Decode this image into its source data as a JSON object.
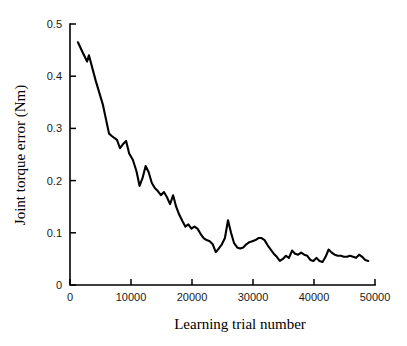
{
  "chart_data": {
    "type": "line",
    "title": "",
    "subtitle": "",
    "xlabel": "Learning trial number",
    "ylabel": "Joint torque error (Nm)",
    "xlim": [
      0,
      50000
    ],
    "ylim": [
      0,
      0.5
    ],
    "xticks": [
      0,
      10000,
      20000,
      30000,
      40000,
      50000
    ],
    "xtick_labels": [
      "0",
      "10000",
      "20000",
      "30000",
      "40000",
      "50000"
    ],
    "yticks": [
      0,
      0.1,
      0.2,
      0.3,
      0.4,
      0.5
    ],
    "ytick_labels": [
      "0",
      "0.1",
      "0.2",
      "0.3",
      "0.4",
      "0.5"
    ],
    "grid": false,
    "legend": "none",
    "line_color": "#000000",
    "series": [
      {
        "name": "Joint torque error",
        "x": [
          1300,
          2100,
          2800,
          3100,
          4200,
          5400,
          6400,
          6900,
          7700,
          8200,
          8700,
          9200,
          9700,
          10300,
          10900,
          11400,
          11900,
          12400,
          12900,
          13400,
          13900,
          14400,
          14900,
          15400,
          15900,
          16400,
          16900,
          17400,
          17900,
          18400,
          18900,
          19400,
          19900,
          20400,
          20900,
          21400,
          21900,
          22400,
          22900,
          23400,
          23900,
          24400,
          24900,
          25400,
          25900,
          26400,
          26900,
          27400,
          27900,
          28400,
          28900,
          29400,
          29900,
          30400,
          30900,
          31400,
          31900,
          32400,
          32900,
          33400,
          33900,
          34400,
          34900,
          35400,
          35900,
          36400,
          36900,
          37400,
          37900,
          38400,
          38900,
          39400,
          39900,
          40400,
          40900,
          41400,
          41900,
          42400,
          42900,
          43400,
          43900,
          44400,
          44900,
          45400,
          45900,
          46400,
          46900,
          47400,
          47900,
          48400,
          48900
        ],
        "y": [
          0.465,
          0.445,
          0.428,
          0.44,
          0.392,
          0.345,
          0.29,
          0.285,
          0.278,
          0.262,
          0.27,
          0.276,
          0.252,
          0.24,
          0.218,
          0.19,
          0.205,
          0.228,
          0.216,
          0.196,
          0.186,
          0.18,
          0.172,
          0.178,
          0.168,
          0.155,
          0.172,
          0.15,
          0.135,
          0.123,
          0.112,
          0.116,
          0.108,
          0.112,
          0.108,
          0.098,
          0.09,
          0.086,
          0.084,
          0.078,
          0.063,
          0.07,
          0.078,
          0.09,
          0.124,
          0.1,
          0.08,
          0.072,
          0.07,
          0.072,
          0.078,
          0.082,
          0.084,
          0.086,
          0.09,
          0.09,
          0.086,
          0.076,
          0.068,
          0.06,
          0.054,
          0.046,
          0.05,
          0.056,
          0.052,
          0.066,
          0.06,
          0.058,
          0.062,
          0.058,
          0.056,
          0.048,
          0.046,
          0.052,
          0.046,
          0.044,
          0.054,
          0.068,
          0.062,
          0.058,
          0.056,
          0.056,
          0.054,
          0.054,
          0.056,
          0.054,
          0.052,
          0.058,
          0.054,
          0.048,
          0.046
        ]
      }
    ]
  }
}
